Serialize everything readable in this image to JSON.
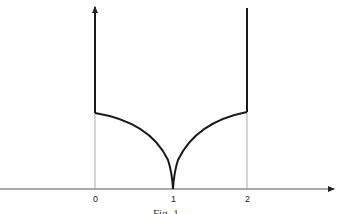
{
  "figure": {
    "caption": "Fig. 1",
    "x_axis": {
      "ticks": [
        {
          "label": "0",
          "x": 95
        },
        {
          "label": "1",
          "x": 173
        },
        {
          "label": "2",
          "x": 247
        }
      ]
    },
    "curve": {
      "description": "Function graph: vertical line from top down at x=0 to a corner, concave-up arc descending to a cusp at x=1 on the axis, symmetric arc rising to a corner at x=2, then vertical line upward to an arrow",
      "left_corner": {
        "x": 0,
        "label": "0"
      },
      "cusp": {
        "x": 1,
        "label": "1"
      },
      "right_corner": {
        "x": 2,
        "label": "2"
      }
    },
    "colors": {
      "curve": "#1a1a1a",
      "axis": "#555555",
      "guides": "#9a9a9a"
    }
  }
}
